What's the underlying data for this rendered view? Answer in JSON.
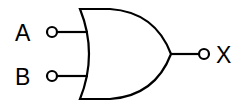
{
  "diagram": {
    "gate_type": "OR",
    "inputs": [
      {
        "label": "A"
      },
      {
        "label": "B"
      }
    ],
    "output": {
      "label": "X"
    },
    "colors": {
      "stroke": "#000000",
      "background": "#ffffff"
    }
  }
}
